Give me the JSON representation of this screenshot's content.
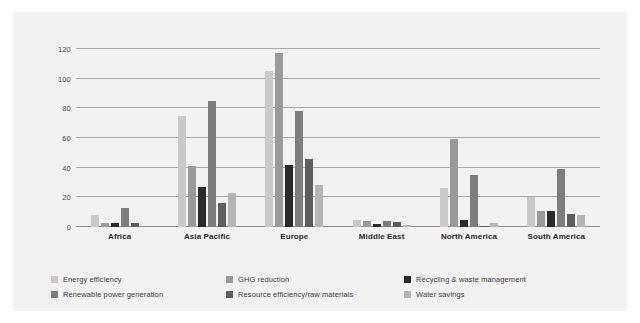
{
  "chart_data": {
    "type": "bar",
    "title": "",
    "subtitle": "",
    "xlabel": "",
    "ylabel": "",
    "ylim": [
      0,
      120
    ],
    "yticks": [
      0,
      20,
      40,
      60,
      80,
      100,
      120
    ],
    "grid": true,
    "legend_position": "bottom",
    "categories": [
      "Africa",
      "Asia Pacific",
      "Europe",
      "Middle East",
      "North America",
      "South America"
    ],
    "series": [
      {
        "name": "Energy efficiency",
        "color": "#c9c9c9",
        "values": [
          8,
          75,
          105,
          5,
          26,
          20
        ]
      },
      {
        "name": "GHG reduction",
        "color": "#9a9a9a",
        "values": [
          2.5,
          41,
          117,
          4,
          59,
          11
        ]
      },
      {
        "name": "Recycling & waste management",
        "color": "#2b2b2b",
        "values": [
          3,
          27,
          42,
          2,
          5,
          11
        ]
      },
      {
        "name": "Renewable power generation",
        "color": "#7d7d7d",
        "values": [
          13,
          85,
          78,
          4,
          35,
          39
        ]
      },
      {
        "name": "Resource efficiency/raw materials",
        "color": "#5e5e5e",
        "values": [
          3,
          16,
          46,
          3.5,
          1,
          9
        ]
      },
      {
        "name": "Water savings",
        "color": "#b5b5b5",
        "values": [
          0,
          23,
          28,
          1.5,
          3,
          8
        ]
      }
    ]
  },
  "legend": {
    "items": [
      {
        "label": "Energy efficiency",
        "color": "#c9c9c9"
      },
      {
        "label": "GHG reduction",
        "color": "#9a9a9a"
      },
      {
        "label": "Recycling & waste management",
        "color": "#2b2b2b"
      },
      {
        "label": "Renewable power generation",
        "color": "#7d7d7d"
      },
      {
        "label": "Resource efficiency/raw materials",
        "color": "#5e5e5e"
      },
      {
        "label": "Water savings",
        "color": "#b5b5b5"
      }
    ]
  },
  "theme": {
    "panel_background": "#f2f2f2",
    "page_background": "#ffffff",
    "gridline_color": "#a8a8a8",
    "axis_text_color": "#4a4a4a",
    "category_text_color": "#2b2b2b"
  }
}
